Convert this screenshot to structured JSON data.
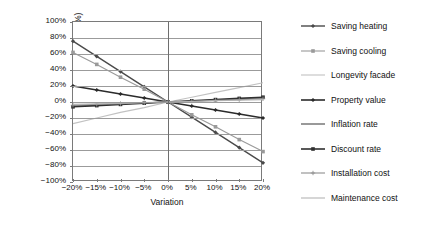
{
  "chart_data": {
    "type": "line",
    "title": "",
    "xlabel": "Variation",
    "ylabel": "NPV (€/mq.) variation (%)",
    "x": [
      -20,
      -15,
      -10,
      -5,
      0,
      5,
      10,
      15,
      20
    ],
    "xtick_labels": [
      "−20%",
      "−15%",
      "−10%",
      "−5%",
      "0%",
      "5%",
      "10%",
      "15%",
      "20%"
    ],
    "ytick_labels": [
      "100%",
      "80%",
      "60%",
      "40%",
      "20%",
      "0%",
      "−20%",
      "−40%",
      "−60%",
      "−80%",
      "−100%"
    ],
    "ytick_values": [
      100,
      80,
      60,
      40,
      20,
      0,
      -20,
      -40,
      -60,
      -80,
      -100
    ],
    "xlim": [
      -20,
      20
    ],
    "ylim": [
      -100,
      100
    ],
    "grid": true,
    "legend_position": "right",
    "series": [
      {
        "name": "Saving heating",
        "color": "#4a4a4a",
        "width": 1.4,
        "dash": "none",
        "marker": "diamond",
        "values": [
          76,
          57,
          38,
          19,
          0,
          -19,
          -38,
          -57,
          -76
        ]
      },
      {
        "name": "Saving cooling",
        "color": "#9a9a9a",
        "width": 1.1,
        "dash": "none",
        "marker": "square",
        "values": [
          62,
          47,
          31,
          16,
          0,
          -16,
          -31,
          -47,
          -62
        ]
      },
      {
        "name": "Longevity facade",
        "color": "#c2c2c2",
        "width": 1.1,
        "dash": "none",
        "marker": "none",
        "values": [
          -27,
          -20,
          -13,
          -7,
          0,
          6,
          12,
          18,
          24
        ]
      },
      {
        "name": "Property value",
        "color": "#2b2b2b",
        "width": 1.6,
        "dash": "none",
        "marker": "diamond",
        "values": [
          20,
          15,
          10,
          5,
          0,
          -5,
          -10,
          -15,
          -20
        ]
      },
      {
        "name": "Inflation rate",
        "color": "#555555",
        "width": 1.2,
        "dash": "none",
        "marker": "none",
        "values": [
          -5,
          -4,
          -2.5,
          -1.2,
          0,
          1.2,
          2.5,
          4,
          5
        ]
      },
      {
        "name": "Discount rate",
        "color": "#303030",
        "width": 1.6,
        "dash": "none",
        "marker": "square",
        "values": [
          -6,
          -4.5,
          -3,
          -1.5,
          0,
          1.5,
          3,
          4.5,
          6
        ]
      },
      {
        "name": "Installation cost",
        "color": "#8e8e8e",
        "width": 1.1,
        "dash": "none",
        "marker": "plus",
        "values": [
          -4,
          -3,
          -2,
          -1,
          0,
          1,
          2,
          3,
          4
        ]
      },
      {
        "name": "Maintenance cost",
        "color": "#b5b5b5",
        "width": 1.1,
        "dash": "none",
        "marker": "none",
        "values": [
          -3,
          -2.2,
          -1.5,
          -0.7,
          0,
          0.7,
          1.5,
          2.2,
          3
        ]
      }
    ]
  },
  "legend": {
    "items": [
      {
        "label": "Saving heating"
      },
      {
        "label": "Saving cooling"
      },
      {
        "label": "Longevity facade"
      },
      {
        "label": "Property value"
      },
      {
        "label": "Inflation rate"
      },
      {
        "label": "Discount rate"
      },
      {
        "label": "Installation cost"
      },
      {
        "label": "Maintenance cost"
      }
    ]
  }
}
